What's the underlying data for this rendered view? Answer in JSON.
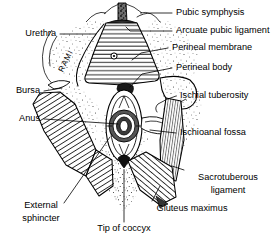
{
  "figure": {
    "background_color": "#ffffff",
    "ink_color": "#000000",
    "width": 276,
    "height": 243
  },
  "labels": {
    "pubic_symphysis": "Pubic symphysis",
    "arcuate_pubic_ligament": "Arcuate pubic ligament",
    "perineal_membrane": "Perineal membrane",
    "perineal_body": "Perineal body",
    "ischial_tuberosity": "Ischial tuberosity",
    "ischioanal_fossa": "Ischioanal fossa",
    "sacrotuberous_ligament_line1": "Sacrotuberous",
    "sacrotuberous_ligament_line2": "ligament",
    "gluteus_maximus": "Gluteus maximus",
    "tip_of_coccyx": "Tip of coccyx",
    "external_sphincter_line1": "External",
    "external_sphincter_line2": "sphincter",
    "anus": "Anus",
    "bursa": "Bursa",
    "urethra": "Urethra",
    "rami": "RAMI"
  },
  "structures": [
    {
      "id": "pubic-symphysis",
      "name": "Pubic symphysis",
      "side": "midline",
      "rendering": "dark-stippled-band"
    },
    {
      "id": "arcuate-pubic-ligament",
      "name": "Arcuate pubic ligament",
      "side": "midline",
      "rendering": "dark-arch"
    },
    {
      "id": "perineal-membrane",
      "name": "Perineal membrane",
      "side": "midline",
      "rendering": "horizontal-hatched-triangle"
    },
    {
      "id": "urethral-opening",
      "name": "Urethra",
      "side": "midline",
      "rendering": "small-circle"
    },
    {
      "id": "ischiopubic-rami",
      "name": "Rami",
      "side": "bilateral",
      "rendering": "outline-edge"
    },
    {
      "id": "perineal-body",
      "name": "Perineal body",
      "side": "midline",
      "rendering": "dark-node"
    },
    {
      "id": "external-anal-sphincter",
      "name": "External sphincter",
      "side": "midline",
      "rendering": "concentric-ovals"
    },
    {
      "id": "anus",
      "name": "Anus",
      "side": "midline",
      "rendering": "central-slit"
    },
    {
      "id": "ischial-tuberosity",
      "name": "Ischial tuberosity",
      "side": "right",
      "rendering": "stippled-bone-mass"
    },
    {
      "id": "ischioanal-fossa",
      "name": "Ischioanal fossa",
      "side": "bilateral",
      "rendering": "stippled-fat-space"
    },
    {
      "id": "sacrotuberous-ligament",
      "name": "Sacrotuberous ligament",
      "side": "right",
      "rendering": "fine-striated-band"
    },
    {
      "id": "gluteus-maximus",
      "name": "Gluteus maximus",
      "side": "bilateral",
      "rendering": "diagonal-hatched-band"
    },
    {
      "id": "bursa",
      "name": "Bursa",
      "side": "left",
      "rendering": "small-curved-outline"
    },
    {
      "id": "tip-of-coccyx",
      "name": "Tip of coccyx",
      "side": "midline",
      "rendering": "apex-point"
    }
  ]
}
